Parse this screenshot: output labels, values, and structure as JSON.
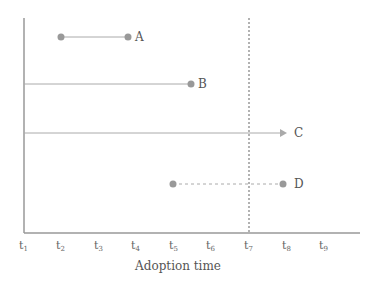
{
  "diagram": {
    "xlabel": "Adoption time",
    "ticks": [
      {
        "base": "t",
        "sub": "1",
        "x": 24
      },
      {
        "base": "t",
        "sub": "2",
        "x": 61
      },
      {
        "base": "t",
        "sub": "3",
        "x": 99
      },
      {
        "base": "t",
        "sub": "4",
        "x": 136
      },
      {
        "base": "t",
        "sub": "5",
        "x": 174
      },
      {
        "base": "t",
        "sub": "6",
        "x": 211
      },
      {
        "base": "t",
        "sub": "7",
        "x": 249
      },
      {
        "base": "t",
        "sub": "8",
        "x": 287
      },
      {
        "base": "t",
        "sub": "9",
        "x": 324
      }
    ],
    "series": [
      {
        "label": "A",
        "start": "t2",
        "end": "t4",
        "style": "solid",
        "start_marker": "dot",
        "end_marker": "dot"
      },
      {
        "label": "B",
        "start": "t1",
        "end": "t5",
        "style": "solid",
        "start_marker": "none",
        "end_marker": "dot"
      },
      {
        "label": "C",
        "start": "t1",
        "end": "t8",
        "style": "solid",
        "start_marker": "none",
        "end_marker": "arrow"
      },
      {
        "label": "D",
        "start": "t5",
        "end": "t8",
        "style": "dashed",
        "start_marker": "dot",
        "end_marker": "dot"
      }
    ],
    "reference_line": {
      "at": "t7",
      "style": "dotted"
    },
    "colors": {
      "line": "#aaaaaa",
      "dot": "#999999",
      "axis": "#999999",
      "text": "#555555"
    }
  }
}
